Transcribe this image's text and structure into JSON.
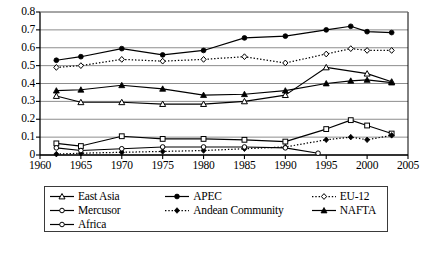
{
  "chart_data": {
    "type": "line",
    "title": "",
    "xlabel": "",
    "ylabel": "",
    "xlim": [
      1960,
      2005
    ],
    "ylim": [
      0,
      0.8
    ],
    "grid": "horizontal",
    "legend_position": "below",
    "x_ticks": [
      "1960",
      "1965",
      "1970",
      "1975",
      "1980",
      "1985",
      "1990",
      "1995",
      "2000",
      "2005"
    ],
    "x_tick_values": [
      1960,
      1965,
      1970,
      1975,
      1980,
      1985,
      1990,
      1995,
      2000,
      2005
    ],
    "y_ticks": [
      "0",
      "0.1",
      "0.2",
      "0.3",
      "0.4",
      "0.5",
      "0.6",
      "0.7",
      "0.8"
    ],
    "y_tick_values": [
      0,
      0.1,
      0.2,
      0.3,
      0.4,
      0.5,
      0.6,
      0.7,
      0.8
    ],
    "series": [
      {
        "name": "East Asia",
        "marker": "open-triangle",
        "line": "solid",
        "x": [
          1962,
          1965,
          1970,
          1975,
          1980,
          1985,
          1990,
          1995,
          2000,
          2003
        ],
        "values": [
          0.33,
          0.295,
          0.295,
          0.285,
          0.285,
          0.3,
          0.335,
          0.49,
          0.455,
          0.41
        ]
      },
      {
        "name": "APEC",
        "marker": "filled-circle",
        "line": "solid",
        "x": [
          1962,
          1965,
          1970,
          1975,
          1980,
          1985,
          1990,
          1995,
          1998,
          2000,
          2003
        ],
        "values": [
          0.53,
          0.55,
          0.595,
          0.56,
          0.585,
          0.655,
          0.665,
          0.7,
          0.72,
          0.69,
          0.685
        ]
      },
      {
        "name": "EU-12",
        "marker": "open-diamond",
        "line": "dotted",
        "x": [
          1962,
          1965,
          1970,
          1975,
          1980,
          1985,
          1990,
          1995,
          1998,
          2000,
          2003
        ],
        "values": [
          0.49,
          0.5,
          0.535,
          0.525,
          0.535,
          0.55,
          0.515,
          0.565,
          0.595,
          0.585,
          0.585
        ]
      },
      {
        "name": "Mercusor",
        "marker": "open-square",
        "line": "solid",
        "x": [
          1962,
          1965,
          1970,
          1975,
          1980,
          1985,
          1990,
          1995,
          1998,
          2000,
          2003
        ],
        "values": [
          0.065,
          0.05,
          0.105,
          0.09,
          0.09,
          0.085,
          0.075,
          0.145,
          0.195,
          0.165,
          0.12
        ]
      },
      {
        "name": "Andean Community",
        "marker": "filled-diamond",
        "line": "dotted",
        "x": [
          1962,
          1965,
          1970,
          1975,
          1980,
          1985,
          1990,
          1995,
          1998,
          2000,
          2003
        ],
        "values": [
          0.005,
          0.01,
          0.015,
          0.02,
          0.025,
          0.035,
          0.045,
          0.085,
          0.1,
          0.085,
          0.11
        ]
      },
      {
        "name": "NAFTA",
        "marker": "filled-triangle",
        "line": "solid",
        "x": [
          1962,
          1965,
          1970,
          1975,
          1980,
          1985,
          1990,
          1995,
          1998,
          2000,
          2003
        ],
        "values": [
          0.36,
          0.365,
          0.39,
          0.37,
          0.335,
          0.34,
          0.36,
          0.4,
          0.415,
          0.42,
          0.405
        ]
      },
      {
        "name": "Africa",
        "marker": "open-circle",
        "line": "solid",
        "x": [
          1962,
          1965,
          1970,
          1975,
          1980,
          1985,
          1990,
          1994
        ],
        "values": [
          0.04,
          0.025,
          0.035,
          0.045,
          0.045,
          0.045,
          0.04,
          0.01
        ]
      }
    ]
  },
  "legend": {
    "rows": [
      [
        {
          "label": "East Asia",
          "marker": "open-triangle",
          "line": "solid"
        },
        {
          "label": "APEC",
          "marker": "filled-circle",
          "line": "solid"
        },
        {
          "label": "EU-12",
          "marker": "open-diamond",
          "line": "dotted"
        }
      ],
      [
        {
          "label": "Mercusor",
          "marker": "open-circle",
          "line": "solid"
        },
        {
          "label": "Andean Community",
          "marker": "filled-diamond",
          "line": "dotted"
        },
        {
          "label": "NAFTA",
          "marker": "filled-triangle",
          "line": "solid"
        }
      ],
      [
        {
          "label": "Africa",
          "marker": "open-circle",
          "line": "solid"
        }
      ]
    ]
  },
  "caption": {
    "text": ""
  },
  "colors": {
    "line": "#000000",
    "grid": "#808080",
    "axis": "#000000",
    "background": "#ffffff",
    "legend_border": "#3a3a3a"
  }
}
